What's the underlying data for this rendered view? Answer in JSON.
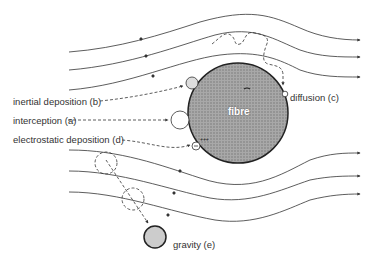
{
  "diagram": {
    "fibre_label": "fibre",
    "labels": {
      "inertial": "inertial deposition (b)",
      "interception": "interception (a)",
      "electrostatic": "electrostatic deposition (d)",
      "diffusion": "diffusion (c)",
      "gravity": "gravity (e)"
    },
    "colors": {
      "fibre_fill": "#9a9a9a",
      "stroke": "#333333",
      "particle_fill": "#d8d8d8"
    }
  }
}
